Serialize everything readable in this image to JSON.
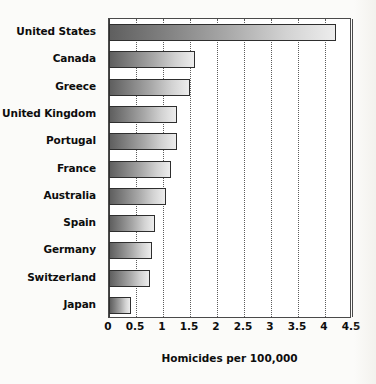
{
  "chart_data": {
    "type": "bar",
    "orientation": "horizontal",
    "title": "",
    "subtitle": "",
    "xlabel": "Homicides per 100,000",
    "ylabel": "",
    "xlim": [
      0,
      4.5
    ],
    "xticks": [
      "0",
      "0.5",
      "1",
      "1.5",
      "2",
      "2.5",
      "3",
      "3.5",
      "4",
      "4.5"
    ],
    "xtick_values": [
      0,
      0.5,
      1,
      1.5,
      2,
      2.5,
      3,
      3.5,
      4,
      4.5
    ],
    "grid": "vertical-dotted",
    "legend": "none",
    "categories": [
      "United States",
      "Canada",
      "Greece",
      "United Kingdom",
      "Portugal",
      "France",
      "Australia",
      "Spain",
      "Germany",
      "Switzerland",
      "Japan"
    ],
    "values": [
      4.2,
      1.6,
      1.5,
      1.25,
      1.25,
      1.15,
      1.05,
      0.85,
      0.8,
      0.75,
      0.4
    ],
    "series": [
      {
        "name": "Homicides per 100,000",
        "values": [
          4.2,
          1.6,
          1.5,
          1.25,
          1.25,
          1.15,
          1.05,
          0.85,
          0.8,
          0.75,
          0.4
        ]
      }
    ]
  },
  "style": {
    "bar_gradient_start": "#5f5f5f",
    "bar_gradient_end": "#ededed",
    "bar_border": "#2e2e2e",
    "axis_color": "#4a4a4a",
    "gridline_color": "#5c5c5c",
    "text_color": "#0d0d0d",
    "plot_background": "#ffffff",
    "page_background": "#fbfbf9"
  }
}
